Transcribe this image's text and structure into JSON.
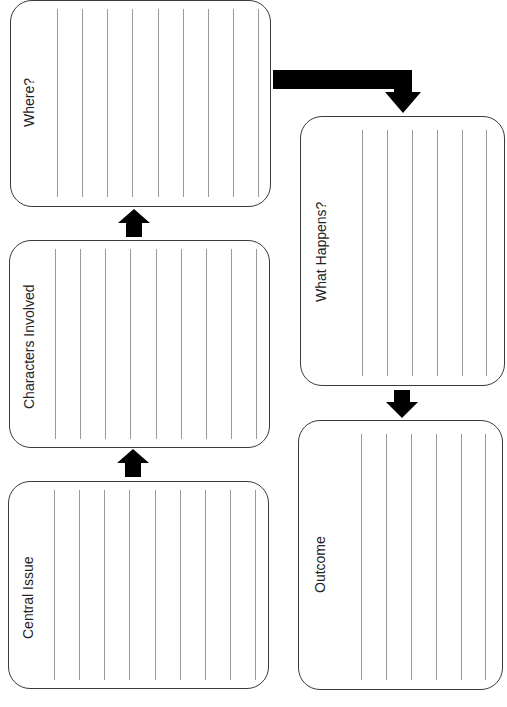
{
  "boxes": {
    "where": {
      "label": "Where?"
    },
    "characters": {
      "label": "Characters Involved"
    },
    "central_issue": {
      "label": "Central Issue"
    },
    "what_happens": {
      "label": "What Happens?"
    },
    "outcome": {
      "label": "Outcome"
    }
  },
  "colors": {
    "border": "#3a3a3a",
    "lines": "#9a9a9a",
    "arrows": "#000000"
  }
}
